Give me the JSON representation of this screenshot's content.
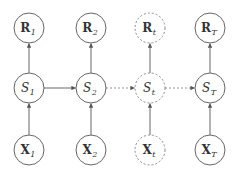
{
  "diagram": {
    "type": "graphical-model",
    "columns": [
      {
        "id": "1",
        "style": "solid",
        "cx": 29,
        "reward": {
          "base": "R",
          "sub": "1"
        },
        "state": {
          "base": "S",
          "sub": "1"
        },
        "input": {
          "base": "X",
          "sub": "1"
        }
      },
      {
        "id": "2",
        "style": "solid",
        "cx": 91,
        "reward": {
          "base": "R",
          "sub": "2"
        },
        "state": {
          "base": "S",
          "sub": "2"
        },
        "input": {
          "base": "X",
          "sub": "2"
        }
      },
      {
        "id": "t",
        "style": "dashed",
        "cx": 150,
        "reward": {
          "base": "R",
          "sub": "t"
        },
        "state": {
          "base": "S",
          "sub": "t"
        },
        "input": {
          "base": "X",
          "sub": "t"
        }
      },
      {
        "id": "T",
        "style": "solid",
        "cx": 210,
        "reward": {
          "base": "R",
          "sub": "T"
        },
        "state": {
          "base": "S",
          "sub": "T"
        },
        "input": {
          "base": "X",
          "sub": "T"
        }
      }
    ],
    "rows": {
      "reward_cy": 28,
      "state_cy": 88,
      "input_cy": 150
    },
    "radius": 15,
    "edges": [
      {
        "from": "X1",
        "to": "S1",
        "style": "solid"
      },
      {
        "from": "X2",
        "to": "S2",
        "style": "solid"
      },
      {
        "from": "Xt",
        "to": "St",
        "style": "solid"
      },
      {
        "from": "XT",
        "to": "ST",
        "style": "solid"
      },
      {
        "from": "S1",
        "to": "R1",
        "style": "solid"
      },
      {
        "from": "S2",
        "to": "R2",
        "style": "solid"
      },
      {
        "from": "St",
        "to": "Rt",
        "style": "solid"
      },
      {
        "from": "ST",
        "to": "RT",
        "style": "solid"
      },
      {
        "from": "S1",
        "to": "S2",
        "style": "solid"
      },
      {
        "from": "S2",
        "to": "St",
        "style": "dashed"
      },
      {
        "from": "St",
        "to": "ST",
        "style": "dashed"
      }
    ],
    "colors": {
      "stroke": "#666666",
      "text": "#333333",
      "background": "#ffffff"
    }
  }
}
